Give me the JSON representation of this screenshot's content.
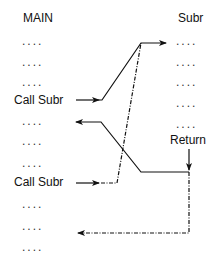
{
  "main": {
    "title": "MAIN",
    "lines": [
      {
        "text": "....",
        "kind": "dots"
      },
      {
        "text": "....",
        "kind": "dots"
      },
      {
        "text": "....",
        "kind": "dots"
      },
      {
        "text": "Call Subr",
        "kind": "call"
      },
      {
        "text": "....",
        "kind": "dots"
      },
      {
        "text": "....",
        "kind": "dots"
      },
      {
        "text": "....",
        "kind": "dots"
      },
      {
        "text": "Call Subr",
        "kind": "call"
      },
      {
        "text": "....",
        "kind": "dots"
      },
      {
        "text": "....",
        "kind": "dots"
      },
      {
        "text": "....",
        "kind": "dots"
      }
    ]
  },
  "subr": {
    "title": "Subr",
    "lines": [
      {
        "text": "...."
      },
      {
        "text": "...."
      },
      {
        "text": "...."
      },
      {
        "text": "...."
      },
      {
        "text": "...."
      }
    ],
    "return_label": "Return"
  },
  "edges": {
    "call1": {
      "style": "solid",
      "from": "Call Subr (1)",
      "to": "Subr entry"
    },
    "return1": {
      "style": "solid",
      "from": "Return",
      "to": "MAIN line after Call Subr (1)"
    },
    "call2": {
      "style": "dashed",
      "from": "Call Subr (2)",
      "to": "Subr entry"
    },
    "return2": {
      "style": "dashed",
      "from": "Return",
      "to": "MAIN line after Call Subr (2)"
    }
  },
  "colors": {
    "line": "#111111",
    "text": "#111111",
    "background": "#ffffff"
  }
}
